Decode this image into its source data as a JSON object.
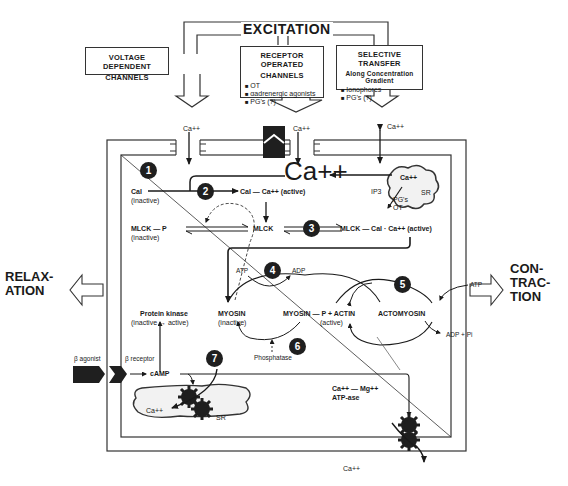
{
  "title": "EXCITATION",
  "sources": {
    "voltage": {
      "title_line1": "VOLTAGE DEPENDENT",
      "title_line2": "CHANNELS"
    },
    "receptor": {
      "title_line1": "RECEPTOR OPERATED",
      "title_line2": "CHANNELS",
      "items": [
        "OT",
        "αadrenergic agonists",
        "PG's (?)"
      ]
    },
    "selective": {
      "title_line1": "SELECTIVE TRANSFER",
      "subtitle": "Along Concentration Gradient",
      "items": [
        "Ionophores",
        "PG's (?)"
      ]
    }
  },
  "labels": {
    "ca_in_1": "Ca++",
    "ca_in_2": "Ca++",
    "ca_in_3": "Ca++",
    "ca_center": "Ca++",
    "sr_top_ca": "Ca++",
    "sr_top": "SR",
    "ip3": "IP3",
    "pgs_ot_1": "PG's",
    "pgs_ot_2": "OT",
    "cal": "Cal",
    "cal_inactive": "(inactive)",
    "cal_ca_active": "Cal — Ca++ (active)",
    "mlck_p": "MLCK — P",
    "mlck_p_inactive": "(inactive)",
    "mlck": "MLCK",
    "mlck_cal_ca": "MLCK — Cal · Ca++ (active)",
    "atp_4": "ATP",
    "adp_4": "ADP",
    "atp_5": "ATP",
    "adp_pi": "ADP + Pi",
    "protein_kinase": "Protein kinase",
    "protein_kinase_state": "(inactive → active)",
    "myosin": "MYOSIN",
    "myosin_inactive": "(inactive)",
    "myosin_p_actin": "MYOSIN — P + ACTIN",
    "myosin_p_active": "(active)",
    "actomyosin": "ACTOMYOSIN",
    "phosphatase": "Phosphatase",
    "b_agonist": "β agonist",
    "b_receptor": "β receptor",
    "camp": "cAMP",
    "sr_bottom_ca": "Ca++",
    "sr_bottom": "SR",
    "atpase_1": "Ca++ — Mg++",
    "atpase_2": "ATP-ase",
    "ca_out": "Ca++"
  },
  "steps": [
    "1",
    "2",
    "3",
    "4",
    "5",
    "6",
    "7"
  ],
  "relaxation": {
    "line1": "RELAX-",
    "line2": "ATION"
  },
  "contraction": {
    "line1": "CON-",
    "line2": "TRAC-",
    "line3": "TION"
  }
}
